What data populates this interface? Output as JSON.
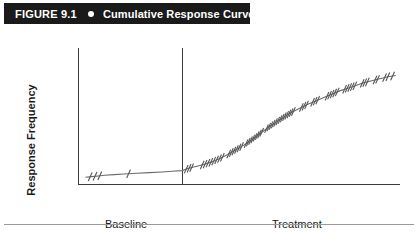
{
  "figure": {
    "number": "FIGURE 9.1",
    "bullet": "filled-circle-bullet",
    "caption": "Cumulative Response Curve"
  },
  "axes": {
    "y_title": "Response Frequency",
    "x_title": "Time"
  },
  "phases": [
    {
      "id": "baseline",
      "label": "Baseline"
    },
    {
      "id": "treatment",
      "label": "Treatment"
    }
  ],
  "colors": {
    "title_bar_background": "#1a1a1a",
    "title_text": "#ffffff",
    "axis_line": "#3a3a3a",
    "phase_line": "#3a3a3a",
    "curve": "#6b6b6b",
    "response_tick": "#555555",
    "footer_rule": "#9a9a9a",
    "page_background": "#ffffff"
  },
  "chart_data": {
    "type": "line",
    "title": "Cumulative Response Curve",
    "xlabel": "Time",
    "ylabel": "Response Frequency",
    "xlim": [
      0,
      100
    ],
    "ylim": [
      0,
      100
    ],
    "grid": false,
    "legend": "none",
    "axis_ticks_shown": false,
    "annotations": [
      {
        "text": "Baseline",
        "x": 16,
        "y": -8
      },
      {
        "text": "Treatment",
        "x": 72,
        "y": -8
      }
    ],
    "phase_change_line": {
      "x": 32.3,
      "label": "baseline-to-treatment"
    },
    "series": [
      {
        "name": "Cumulative responses",
        "note": "Cumulative record: flat during baseline, accelerating then steady rise during treatment",
        "x": [
          2.0,
          4.0,
          6.0,
          8.0,
          11.0,
          14.0,
          18.0,
          22.0,
          26.0,
          29.0,
          32.3,
          34.0,
          36.5,
          39.0,
          41.5,
          44.0,
          46.5,
          49.0,
          51.5,
          54.0,
          56.5,
          59.0,
          61.5,
          64.0,
          66.5,
          69.0,
          71.5,
          74.0,
          76.5,
          79.0,
          81.5,
          84.0,
          86.5,
          89.0,
          91.5,
          94.0,
          96.5,
          99.0
        ],
        "y": [
          5.0,
          5.5,
          6.0,
          6.5,
          7.0,
          7.5,
          8.0,
          8.5,
          9.0,
          9.5,
          10.0,
          11.5,
          13.0,
          14.5,
          16.5,
          19.0,
          22.0,
          25.5,
          29.0,
          33.0,
          37.5,
          42.0,
          46.0,
          50.0,
          53.5,
          56.5,
          59.5,
          62.0,
          64.5,
          67.0,
          69.5,
          71.5,
          73.5,
          75.5,
          77.0,
          78.5,
          80.0,
          81.0
        ]
      }
    ],
    "response_marks": {
      "description": "Small diagonal slash marks on the cumulative curve indicating individual responses",
      "count_baseline": 4,
      "count_treatment": 62,
      "baseline_x": [
        3.5,
        5.0,
        6.5,
        15.5
      ],
      "treatment_x": [
        33.5,
        34.4,
        35.2,
        38.5,
        39.4,
        40.3,
        41.2,
        42.1,
        43.0,
        43.9,
        44.8,
        46.8,
        47.6,
        48.4,
        49.2,
        50.0,
        50.8,
        52.2,
        52.9,
        53.6,
        54.3,
        55.0,
        55.7,
        56.4,
        57.1,
        58.6,
        59.3,
        60.0,
        60.7,
        61.4,
        62.1,
        62.8,
        63.5,
        64.2,
        64.9,
        65.6,
        66.3,
        67.0,
        69.5,
        70.3,
        71.1,
        73.0,
        73.8,
        74.6,
        77.5,
        78.3,
        79.1,
        79.9,
        80.7,
        83.0,
        83.8,
        84.6,
        85.4,
        86.2,
        88.5,
        89.3,
        90.1,
        92.5,
        93.3,
        95.5,
        96.5,
        98.0
      ]
    }
  }
}
